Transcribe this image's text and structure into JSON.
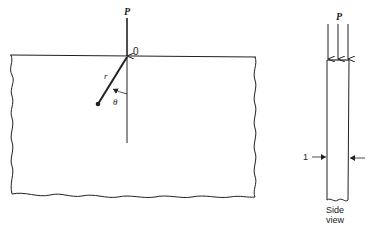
{
  "front_view": {
    "load_label": "P",
    "origin_label": "0",
    "radius_label": "r",
    "angle_label": "θ"
  },
  "side_view": {
    "load_label": "P",
    "thickness_label": "1",
    "caption_line1": "Side",
    "caption_line2": "view"
  },
  "colors": {
    "stroke": "#222222",
    "background": "#ffffff"
  }
}
